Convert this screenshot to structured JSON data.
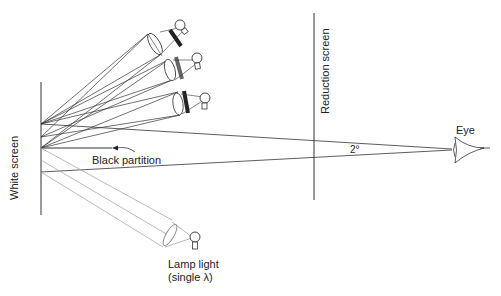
{
  "diagram": {
    "labels": {
      "white_screen": "White screen",
      "reduction_screen": "Reduction screen",
      "eye": "Eye",
      "angle": "2°",
      "black_partition": "Black partition",
      "lamp_light_line1": "Lamp light",
      "lamp_light_line2": "(single λ)"
    },
    "colors": {
      "line": "#333333",
      "gray_ray": "#aaaaaa",
      "filter_dark": "#222222",
      "filter_gray": "#666666"
    },
    "components": [
      "white-screen",
      "three-primary-lamps-with-filters",
      "single-wavelength-lamp",
      "black-partition",
      "reduction-screen",
      "eye"
    ]
  }
}
